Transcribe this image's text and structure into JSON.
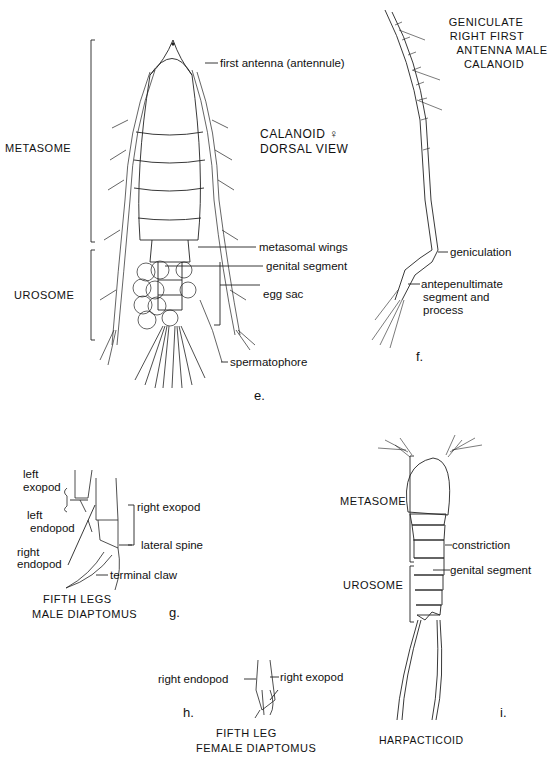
{
  "panels": {
    "e": {
      "figure_letter": "e.",
      "title_line1": "CALANOID ♀",
      "title_line2": "DORSAL  VIEW",
      "brackets": {
        "metasome": "METASOME",
        "urosome": "UROSOME"
      },
      "labels": {
        "first_antenna": "first antenna (antennule)",
        "metasomal_wings": "metasomal wings",
        "genital_segment": "genital segment",
        "egg_sac": "egg sac",
        "spermatophore": "spermatophore"
      }
    },
    "f": {
      "figure_letter": "f.",
      "title_lines": [
        "GENICULATE",
        "RIGHT FIRST",
        "ANTENNA  MALE",
        "CALANOID"
      ],
      "labels": {
        "geniculation": "geniculation",
        "antepenultimate_line1": "antepenultimate",
        "antepenultimate_line2": "segment and",
        "antepenultimate_line3": "process"
      }
    },
    "g": {
      "figure_letter": "g.",
      "caption_line1": "FIFTH  LEGS",
      "caption_line2": "MALE  DIAPTOMUS",
      "labels": {
        "left_exopod_1": "left",
        "left_exopod_2": "exopod",
        "left_endopod_1": "left",
        "left_endopod_2": "endopod",
        "right_endopod_1": "right",
        "right_endopod_2": "endopod",
        "right_exopod": "right exopod",
        "lateral_spine": "lateral  spine",
        "terminal_claw": "terminal  claw"
      }
    },
    "h": {
      "figure_letter": "h.",
      "caption_line1": "FIFTH  LEG",
      "caption_line2": "FEMALE  DIAPTOMUS",
      "labels": {
        "right_endopod": "right  endopod",
        "right_exopod": "right exopod"
      }
    },
    "i": {
      "figure_letter": "i.",
      "caption": "HARPACTICOID",
      "brackets": {
        "metasome": "METASOME",
        "urosome": "UROSOME"
      },
      "labels": {
        "constriction": "constriction",
        "genital_segment": "genital segment"
      }
    }
  }
}
